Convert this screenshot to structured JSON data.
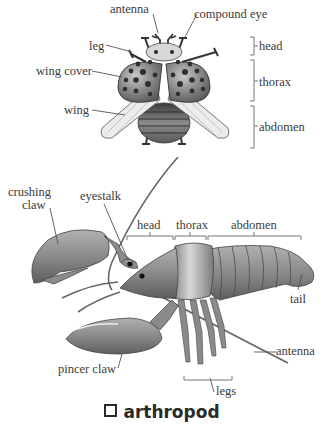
{
  "diagram": {
    "title": "arthropod",
    "title_icon": "square-bullet-icon",
    "beetle": {
      "labels": {
        "antenna": "antenna",
        "compound_eye": "compound eye",
        "leg": "leg",
        "wing_cover": "wing cover",
        "wing": "wing"
      },
      "segments": [
        "head",
        "thorax",
        "abdomen"
      ]
    },
    "lobster": {
      "labels": {
        "crushing_claw_1": "crushing",
        "crushing_claw_2": "claw",
        "eyestalk": "eyestalk",
        "tail": "tail",
        "pincer_claw": "pincer claw",
        "antenna": "antenna",
        "legs": "legs"
      },
      "segments": [
        "head",
        "thorax",
        "abdomen"
      ]
    },
    "colors": {
      "beetle_shell": "#8a8a8a",
      "beetle_spots": "#2f2f2f",
      "wing": "#e4e4e4",
      "lobster_body": "#8c8c8c",
      "lobster_dark": "#6e6e6e",
      "label_text": "#3a3a3a"
    }
  }
}
